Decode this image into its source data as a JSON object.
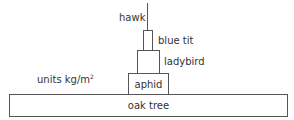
{
  "diagram": {
    "type": "pyramid of biomass",
    "units_label": "units kg/m",
    "units_superscript": "2",
    "levels": [
      {
        "name": "oak tree"
      },
      {
        "name": "aphid"
      },
      {
        "name": "ladybird"
      },
      {
        "name": "blue tit"
      },
      {
        "name": "hawk"
      }
    ]
  }
}
